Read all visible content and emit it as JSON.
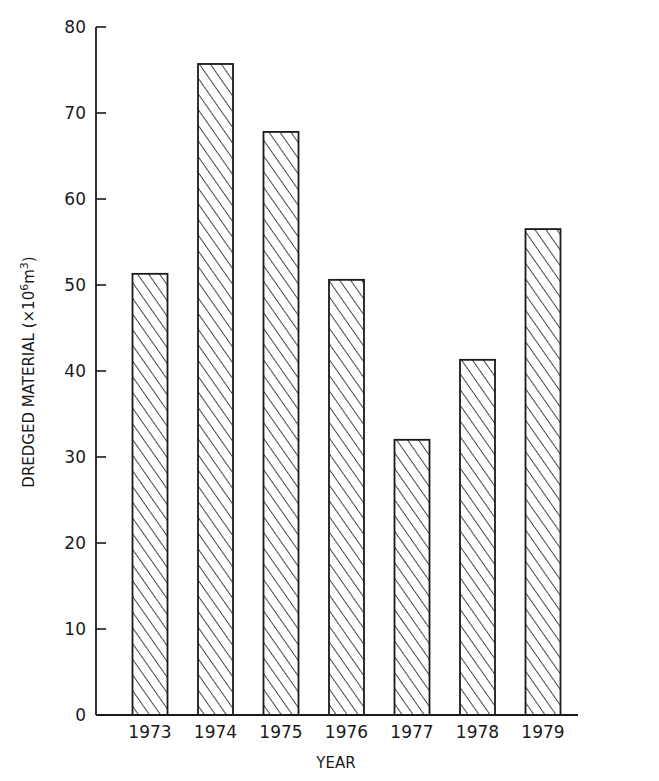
{
  "chart_data": {
    "type": "bar",
    "title": "",
    "xlabel": "YEAR",
    "ylabel": "DREDGED MATERIAL (×10⁶m³)",
    "ylabel_parts": {
      "main": "DREDGED MATERIAL (×10",
      "exp1": "6",
      "mid": "m",
      "exp2": "3",
      "end": ")"
    },
    "categories": [
      "1973",
      "1974",
      "1975",
      "1976",
      "1977",
      "1978",
      "1979"
    ],
    "values": [
      51.3,
      75.7,
      67.8,
      50.6,
      32.0,
      41.3,
      56.5
    ],
    "ylim": [
      0,
      80
    ],
    "yticks": [
      0,
      10,
      20,
      30,
      40,
      50,
      60,
      70,
      80
    ],
    "grid": false,
    "legend": null,
    "bar_fill": "diagonal-hatch",
    "colors": {
      "ink": "#1a1a1a",
      "background": "#ffffff"
    }
  }
}
